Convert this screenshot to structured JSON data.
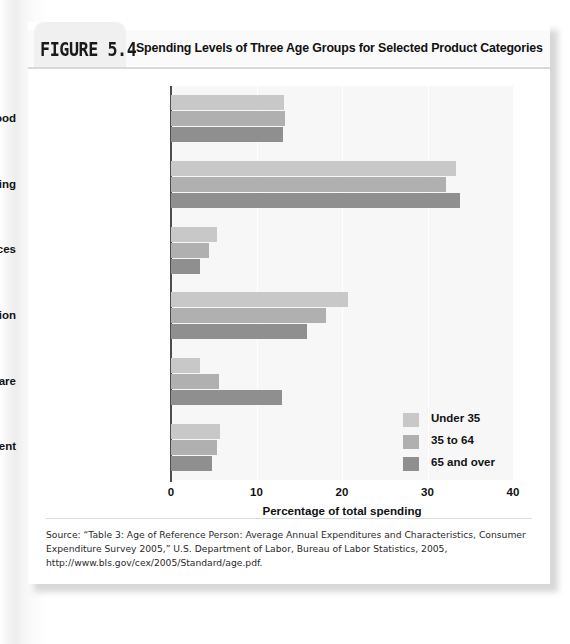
{
  "figure": {
    "label": "FIGURE 5.4",
    "title": "Spending Levels of Three Age Groups for Selected Product Categories"
  },
  "source": {
    "text": "Source: “Table 3: Age of Reference Person: Average Annual Expenditures and Characteristics, Consumer Expenditure Survey 2005,” U.S. Department of Labor, Bureau of Labor Statistics, 2005, http://www.bls.gov/cex/2005/Standard/age.pdf."
  },
  "colors": {
    "under35": "#c8c8c8",
    "age35to64": "#b0b0b0",
    "age65over": "#8f8f8f",
    "axis": "#4d4d4d",
    "plot_background": "#f7f7f7",
    "card": "#ffffff"
  },
  "chart_data": {
    "type": "bar",
    "orientation": "horizontal",
    "title": "Spending Levels of Three Age Groups for Selected Product Categories",
    "xlabel": "Percentage of total spending",
    "ylabel": "",
    "xlim": [
      0,
      40
    ],
    "xticks": [
      0,
      10,
      20,
      30,
      40
    ],
    "grid": true,
    "legend_position": "lower-right",
    "categories": [
      "Food",
      "Housing",
      "Apparel and services",
      "Transportation",
      "Health care",
      "Entertainment"
    ],
    "series": [
      {
        "name": "Under 35",
        "values": [
          13.2,
          33.3,
          5.4,
          20.7,
          3.4,
          5.7
        ]
      },
      {
        "name": "35 to 64",
        "values": [
          13.3,
          32.2,
          4.4,
          18.1,
          5.6,
          5.4
        ]
      },
      {
        "name": "65 and over",
        "values": [
          13.1,
          33.8,
          3.4,
          15.9,
          13.0,
          4.8
        ]
      }
    ]
  }
}
